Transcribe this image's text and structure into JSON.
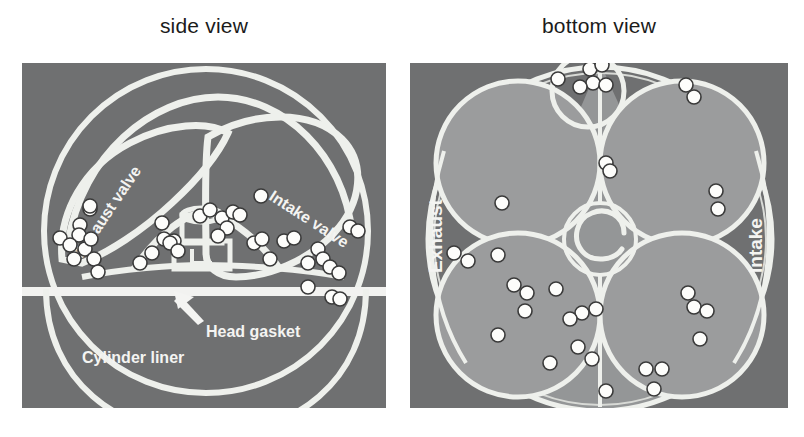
{
  "figure": {
    "background_color": "#ffffff",
    "panel_background_color": "#6f7071",
    "panel_light_color": "#9b9c9d",
    "line_color": "#f2f2f0",
    "marker_fill": "#fdfdfb",
    "marker_stroke": "#3a3a3a",
    "text_color_dark": "#1b1b1b",
    "text_color_light": "#f4f4f2"
  },
  "panels": [
    {
      "id": "side-view",
      "title": "side view",
      "labels": [
        {
          "id": "exhaust-valve",
          "text": "Exhaust valve",
          "rotation": -56
        },
        {
          "id": "intake-valve",
          "text": "Intake valve",
          "rotation": 33
        },
        {
          "id": "head-gasket",
          "text": "Head gasket",
          "rotation": 0
        },
        {
          "id": "cylinder-liner",
          "text": "Cylinder liner",
          "rotation": 0
        }
      ],
      "annotations": [
        {
          "id": "head-gasket-arrow",
          "kind": "arrow",
          "points_to": "head gasket line"
        }
      ],
      "marker_count": 38
    },
    {
      "id": "bottom-view",
      "title": "bottom view",
      "labels": [
        {
          "id": "exhaust",
          "text": "Exhaust",
          "rotation": -90
        },
        {
          "id": "intake",
          "text": "Intake",
          "rotation": -90
        }
      ],
      "annotations": [],
      "marker_count": 34
    }
  ],
  "chart_data": {
    "type": "scatter",
    "xlabel": "",
    "ylabel": "",
    "legend": [],
    "grid": false,
    "series": [
      {
        "name": "side view markers",
        "panel": "side-view",
        "xlim": [
          0,
          364
        ],
        "ylim": [
          0,
          345
        ],
        "points": [
          [
            58,
            162
          ],
          [
            239,
            133
          ],
          [
            68,
            146
          ],
          [
            68,
            143
          ],
          [
            57,
            172
          ],
          [
            63,
            186
          ],
          [
            69,
            176
          ],
          [
            38,
            175
          ],
          [
            48,
            182
          ],
          [
            52,
            196
          ],
          [
            72,
            196
          ],
          [
            76,
            209
          ],
          [
            118,
            200
          ],
          [
            140,
            160
          ],
          [
            142,
            176
          ],
          [
            152,
            178
          ],
          [
            130,
            190
          ],
          [
            178,
            153
          ],
          [
            188,
            147
          ],
          [
            200,
            155
          ],
          [
            205,
            165
          ],
          [
            196,
            173
          ],
          [
            211,
            149
          ],
          [
            218,
            152
          ],
          [
            148,
            180
          ],
          [
            156,
            188
          ],
          [
            232,
            180
          ],
          [
            240,
            176
          ],
          [
            262,
            178
          ],
          [
            272,
            175
          ],
          [
            248,
            196
          ],
          [
            286,
            200
          ],
          [
            296,
            186
          ],
          [
            301,
            196
          ],
          [
            308,
            204
          ],
          [
            317,
            210
          ],
          [
            286,
            224
          ],
          [
            310,
            234
          ],
          [
            318,
            236
          ],
          [
            328,
            164
          ],
          [
            336,
            168
          ]
        ]
      },
      {
        "name": "bottom view markers",
        "panel": "bottom-view",
        "xlim": [
          0,
          378
        ],
        "ylim": [
          0,
          345
        ],
        "points": [
          [
            148,
            16
          ],
          [
            180,
            6
          ],
          [
            192,
            2
          ],
          [
            183,
            20
          ],
          [
            196,
            22
          ],
          [
            170,
            24
          ],
          [
            276,
            22
          ],
          [
            284,
            34
          ],
          [
            92,
            140
          ],
          [
            44,
            190
          ],
          [
            58,
            198
          ],
          [
            88,
            192
          ],
          [
            104,
            222
          ],
          [
            117,
            230
          ],
          [
            146,
            226
          ],
          [
            88,
            272
          ],
          [
            115,
            248
          ],
          [
            172,
            250
          ],
          [
            160,
            256
          ],
          [
            186,
            246
          ],
          [
            168,
            284
          ],
          [
            140,
            300
          ],
          [
            196,
            100
          ],
          [
            200,
            108
          ],
          [
            306,
            128
          ],
          [
            308,
            146
          ],
          [
            284,
            244
          ],
          [
            297,
            248
          ],
          [
            290,
            276
          ],
          [
            182,
            296
          ],
          [
            236,
            306
          ],
          [
            252,
            306
          ],
          [
            196,
            328
          ],
          [
            244,
            326
          ],
          [
            278,
            230
          ]
        ]
      }
    ]
  }
}
